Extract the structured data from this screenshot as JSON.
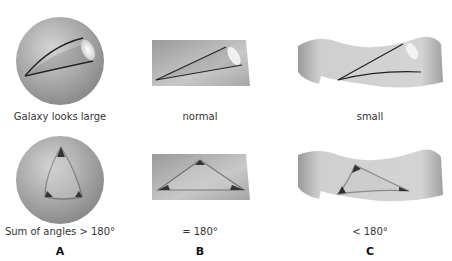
{
  "rows": [
    {
      "name": "galaxy-row",
      "panels": [
        {
          "surface": "sphere",
          "caption": "Galaxy looks large"
        },
        {
          "surface": "flat-plane",
          "caption": "normal"
        },
        {
          "surface": "saddle",
          "caption": "small"
        }
      ]
    },
    {
      "name": "triangle-row",
      "panels": [
        {
          "surface": "sphere",
          "caption": "Sum of angles > 180°"
        },
        {
          "surface": "flat-plane",
          "caption": "= 180°"
        },
        {
          "surface": "saddle",
          "caption": "< 180°"
        }
      ]
    }
  ],
  "columns": [
    "A",
    "B",
    "C"
  ],
  "colors": {
    "surface_light": "#d2d2d2",
    "surface_dark": "#8a8a8a",
    "line": "#222222",
    "galaxy_glow": "#f4f4f4"
  }
}
